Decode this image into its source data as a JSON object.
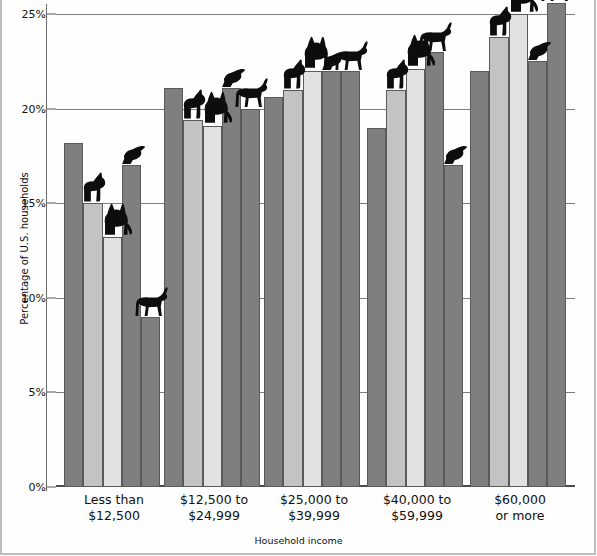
{
  "chart_data": {
    "type": "bar",
    "title": "",
    "xlabel": "Household income",
    "ylabel": "Percentage of U.S. households",
    "ylim": [
      0,
      25
    ],
    "ytick_labels": [
      "0%",
      "5%",
      "10%",
      "15%",
      "20%",
      "25%"
    ],
    "ytick_values": [
      0,
      5,
      10,
      15,
      20,
      25
    ],
    "grid": true,
    "legend_position": "none",
    "categories": [
      "Less than $12,500",
      "$12,500 to $24,999",
      "$25,000 to $39,999",
      "$40,000 to $59,999",
      "$60,000 or more"
    ],
    "category_lines": [
      [
        "Less than",
        "$12,500"
      ],
      [
        "$12,500 to",
        "$24,999"
      ],
      [
        "$25,000 to",
        "$39,999"
      ],
      [
        "$40,000 to",
        "$59,999"
      ],
      [
        "$60,000",
        "or more"
      ]
    ],
    "series": [
      {
        "name": "dog",
        "icon": "dog-icon",
        "shade": "dark",
        "values": [
          18.2,
          21.1,
          20.6,
          19.0,
          22.0
        ]
      },
      {
        "name": "cat",
        "icon": "cat-icon",
        "shade": "mid",
        "values": [
          15.0,
          19.4,
          21.0,
          21.0,
          23.8
        ]
      },
      {
        "name": "bird",
        "icon": "bird-icon",
        "shade": "light",
        "values": [
          13.2,
          19.1,
          22.0,
          22.1,
          25.0
        ]
      },
      {
        "name": "horse",
        "icon": "horse-icon",
        "shade": "dark",
        "values": [
          17.0,
          21.1,
          22.0,
          23.0,
          22.5
        ]
      },
      {
        "name": "other",
        "icon": "horse-icon",
        "shade": "dark",
        "values": [
          9.0,
          20.0,
          22.0,
          17.0,
          25.6
        ]
      }
    ],
    "bar_colors": {
      "dark": "#7f7f7f",
      "mid": "#c3c3c3",
      "light": "#e2e2e2",
      "outline": "#5a5a5a",
      "gridline": "#7d7d7d",
      "axis": "#4a4a4a",
      "background": "#ffffff"
    },
    "animal_markers": [
      {
        "group": 0,
        "bar": 1,
        "icon": "dog-icon"
      },
      {
        "group": 0,
        "bar": 2,
        "icon": "cat-icon"
      },
      {
        "group": 0,
        "bar": 3,
        "icon": "bird-icon"
      },
      {
        "group": 0,
        "bar": 4,
        "icon": "horse-icon"
      },
      {
        "group": 1,
        "bar": 1,
        "icon": "dog-icon"
      },
      {
        "group": 1,
        "bar": 2,
        "icon": "cat-icon"
      },
      {
        "group": 1,
        "bar": 3,
        "icon": "bird-icon"
      },
      {
        "group": 1,
        "bar": 4,
        "icon": "horse-icon"
      },
      {
        "group": 2,
        "bar": 1,
        "icon": "dog-icon"
      },
      {
        "group": 2,
        "bar": 2,
        "icon": "cat-icon"
      },
      {
        "group": 2,
        "bar": 3,
        "icon": "bird-icon"
      },
      {
        "group": 2,
        "bar": 4,
        "icon": "horse-icon"
      },
      {
        "group": 3,
        "bar": 1,
        "icon": "dog-icon"
      },
      {
        "group": 3,
        "bar": 2,
        "icon": "cat-icon"
      },
      {
        "group": 3,
        "bar": 3,
        "icon": "horse-icon"
      },
      {
        "group": 3,
        "bar": 4,
        "icon": "bird-icon"
      },
      {
        "group": 4,
        "bar": 1,
        "icon": "dog-icon"
      },
      {
        "group": 4,
        "bar": 2,
        "icon": "cat-icon"
      },
      {
        "group": 4,
        "bar": 3,
        "icon": "bird-icon"
      },
      {
        "group": 4,
        "bar": 4,
        "icon": "horse-icon"
      }
    ]
  },
  "axis": {
    "y_title": "Percentage of U.S. households",
    "x_title": "Household income"
  }
}
